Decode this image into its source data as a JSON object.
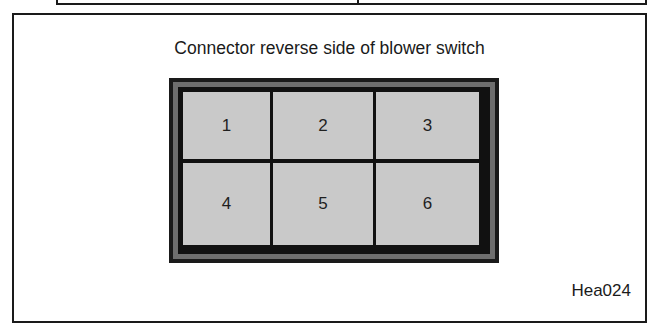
{
  "diagram": {
    "title": "Connector reverse side of blower switch",
    "reference_code": "Hea024",
    "connector": {
      "rows": 2,
      "columns": 3,
      "pins": [
        {
          "number": "1"
        },
        {
          "number": "2"
        },
        {
          "number": "3"
        },
        {
          "number": "4"
        },
        {
          "number": "5"
        },
        {
          "number": "6"
        }
      ]
    },
    "colors": {
      "outline": "#1a1a1a",
      "housing_band": "#6e6e6e",
      "pin_fill": "#c9c9c9"
    }
  }
}
